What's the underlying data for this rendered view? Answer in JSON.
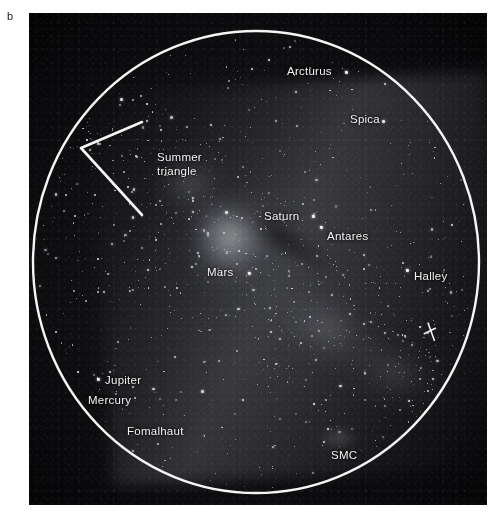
{
  "figure": {
    "panel_letter": "b",
    "caption_type": "all-sky fisheye astrophotograph"
  },
  "overlay": {
    "horizon_circle": {
      "label": "horizon-circle",
      "color": "#f5f5f5",
      "cx_px": 227,
      "cy_px": 249,
      "rx_px": 223,
      "ry_px": 231
    },
    "summer_triangle": {
      "label": "Summer triangle",
      "color": "#f5f5f5",
      "vertices_px": [
        [
          113,
          109
        ],
        [
          52,
          135
        ],
        [
          113,
          202
        ]
      ]
    },
    "comet_marker": {
      "label": "comet-tick-marker",
      "color": "#f2f2f2",
      "x_px": 401,
      "y_px": 319
    }
  },
  "labels": [
    {
      "id": "arcturus",
      "text": "Arcturus",
      "x": 287,
      "y": 65,
      "dot": [
        345,
        71
      ]
    },
    {
      "id": "spica",
      "text": "Spica",
      "x": 350,
      "y": 113,
      "dot": null
    },
    {
      "id": "summer-triangle",
      "text": "Summer\ntriangle",
      "x": 157,
      "y": 151,
      "dot": null
    },
    {
      "id": "saturn",
      "text": "Saturn",
      "x": 264,
      "y": 210,
      "dot": [
        312,
        215
      ]
    },
    {
      "id": "antares",
      "text": "Antares",
      "x": 327,
      "y": 230,
      "dot": [
        320,
        226
      ]
    },
    {
      "id": "mars",
      "text": "Mars",
      "x": 207,
      "y": 266,
      "dot": [
        248,
        272
      ]
    },
    {
      "id": "halley",
      "text": "Halley",
      "x": 414,
      "y": 270,
      "dot": [
        406,
        269
      ]
    },
    {
      "id": "jupiter",
      "text": "Jupiter",
      "x": 105,
      "y": 374,
      "dot": [
        97,
        378
      ]
    },
    {
      "id": "mercury",
      "text": "Mercury",
      "x": 88,
      "y": 394,
      "dot": null
    },
    {
      "id": "fomalhaut",
      "text": "Fomalhaut",
      "x": 127,
      "y": 425,
      "dot": null
    },
    {
      "id": "smc",
      "text": "SMC",
      "x": 331,
      "y": 449,
      "dot": null
    }
  ],
  "sky_objects": {
    "milky_way": "Milky Way band running upper-left to lower-right with galactic bulge near centre",
    "named_stars": [
      "Arcturus",
      "Spica",
      "Antares",
      "Fomalhaut"
    ],
    "planets": [
      "Saturn",
      "Mars",
      "Jupiter",
      "Mercury"
    ],
    "comet": "Halley",
    "galaxies": [
      "SMC"
    ],
    "asterisms": [
      "Summer triangle"
    ]
  },
  "colors": {
    "page_background": "#ffffff",
    "sky_background": "#0c0c0e",
    "overlay_line": "#f5f5f5",
    "label_text": "#f2f2f2",
    "panel_letter": "#1a1a1a"
  }
}
